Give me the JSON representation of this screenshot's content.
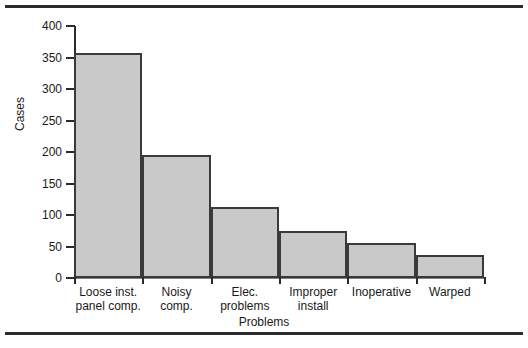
{
  "chart_data": {
    "type": "bar",
    "title": "",
    "xlabel": "Problems",
    "ylabel": "Cases",
    "categories": [
      "Loose inst.\npanel comp.",
      "Noisy\ncomp.",
      "Elec.\nproblems",
      "Improper\ninstall",
      "Inoperative",
      "Warped"
    ],
    "values": [
      357,
      195,
      113,
      74,
      55,
      37
    ],
    "ylim": [
      0,
      400
    ],
    "yticks": [
      0,
      50,
      100,
      150,
      200,
      250,
      300,
      350,
      400
    ],
    "ytick_labels": [
      "0",
      "50",
      "100",
      "150",
      "200",
      "250",
      "300",
      "350",
      "400"
    ],
    "grid": false,
    "legend": null,
    "bar_fill_color": "#c9c9c9",
    "bar_edge_color": "#3a3a3a",
    "axis_color": "#2b2b2b",
    "text_color": "#1a1a1a"
  }
}
